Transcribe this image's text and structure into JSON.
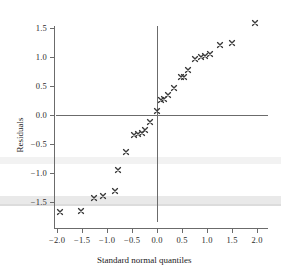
{
  "chart_data": {
    "type": "scatter",
    "title": "",
    "xlabel": "Standard normal quantiles",
    "ylabel": "Residuals",
    "xlim": [
      -2.15,
      2.25
    ],
    "ylim": [
      -1.85,
      1.75
    ],
    "grid": false,
    "legend": "none",
    "marker": "x",
    "marker_color": "#3a3a3a",
    "axis_color": "#6b6b6b",
    "reference_lines": [
      {
        "orientation": "horizontal",
        "value": 0.0
      },
      {
        "orientation": "vertical",
        "value": 0.0
      }
    ],
    "xticks": [
      -2.0,
      -1.5,
      -1.0,
      -0.5,
      0.0,
      0.5,
      1.0,
      1.5,
      2.0
    ],
    "xticklabels": [
      "−2.0",
      "−1.5",
      "−1.0",
      "−0.5",
      "0.0",
      "0.5",
      "1.0",
      "1.5",
      "2.0"
    ],
    "yticks": [
      -1.5,
      -1.0,
      -0.5,
      0.0,
      0.5,
      1.0,
      1.5
    ],
    "yticklabels": [
      "−1.5",
      "−1.0",
      "−0.5",
      "0.0",
      "0.5",
      "1.0",
      "1.5"
    ],
    "points": [
      {
        "x": -1.94,
        "y": -1.67
      },
      {
        "x": -1.52,
        "y": -1.66
      },
      {
        "x": -1.26,
        "y": -1.43
      },
      {
        "x": -1.08,
        "y": -1.4
      },
      {
        "x": -0.84,
        "y": -1.31
      },
      {
        "x": -0.78,
        "y": -0.95
      },
      {
        "x": -0.62,
        "y": -0.64
      },
      {
        "x": -0.46,
        "y": -0.34
      },
      {
        "x": -0.38,
        "y": -0.33
      },
      {
        "x": -0.3,
        "y": -0.31
      },
      {
        "x": -0.24,
        "y": -0.26
      },
      {
        "x": -0.14,
        "y": -0.12
      },
      {
        "x": 0.0,
        "y": 0.07
      },
      {
        "x": 0.08,
        "y": 0.26
      },
      {
        "x": 0.14,
        "y": 0.28
      },
      {
        "x": 0.22,
        "y": 0.34
      },
      {
        "x": 0.34,
        "y": 0.47
      },
      {
        "x": 0.48,
        "y": 0.65
      },
      {
        "x": 0.54,
        "y": 0.65
      },
      {
        "x": 0.62,
        "y": 0.78
      },
      {
        "x": 0.76,
        "y": 0.97
      },
      {
        "x": 0.88,
        "y": 1.0
      },
      {
        "x": 0.96,
        "y": 1.02
      },
      {
        "x": 1.06,
        "y": 1.05
      },
      {
        "x": 1.26,
        "y": 1.2
      },
      {
        "x": 1.5,
        "y": 1.24
      },
      {
        "x": 1.96,
        "y": 1.58
      }
    ]
  }
}
